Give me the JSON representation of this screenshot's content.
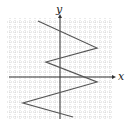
{
  "figure": {
    "type": "coordinate-plane-graph",
    "axis_labels": {
      "x": "x",
      "y": "y"
    },
    "grid": {
      "style": "dotted",
      "color": "#bdbdbd",
      "cell_px": 5,
      "left": 7,
      "top": 18,
      "right": 112,
      "bottom": 119
    },
    "axes": {
      "origin_px": [
        60,
        77
      ],
      "color": "#333333",
      "x_start": 9,
      "x_end": 116,
      "y_start": 119,
      "y_end": 14
    },
    "polyline_color": "#555555",
    "polyline_px": [
      [
        38,
        21
      ],
      [
        97,
        48
      ],
      [
        46,
        62
      ],
      [
        97,
        82
      ],
      [
        23,
        103
      ],
      [
        73,
        117
      ]
    ]
  }
}
